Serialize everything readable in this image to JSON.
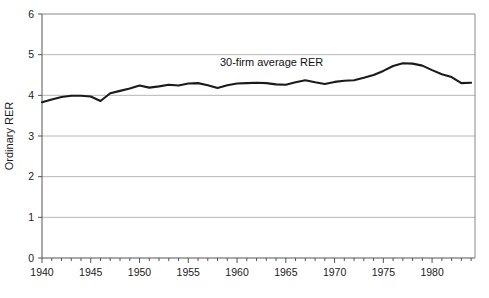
{
  "chart_data": {
    "type": "line",
    "title": "",
    "xlabel": "",
    "ylabel": "Ordinary RER",
    "xlim": [
      1940,
      1984.4
    ],
    "ylim": [
      0,
      6
    ],
    "grid": "horizontal",
    "legend_position": "inline-annotation",
    "ytick_labels": [
      "0",
      "1",
      "2",
      "3",
      "4",
      "5",
      "6"
    ],
    "yticks": [
      0,
      1,
      2,
      3,
      4,
      5,
      6
    ],
    "xtick_labels": [
      "1940",
      "1945",
      "1950",
      "1955",
      "1960",
      "1965",
      "1970",
      "1975",
      "1980"
    ],
    "xticks": [
      1940,
      1945,
      1950,
      1955,
      1960,
      1965,
      1970,
      1975,
      1980
    ],
    "minor_xtick_interval": 1,
    "series": [
      {
        "name": "30-firm average RER",
        "color": "#1a1a1a",
        "x": [
          1940,
          1941,
          1942,
          1943,
          1944,
          1945,
          1946,
          1947,
          1948,
          1949,
          1950,
          1951,
          1952,
          1953,
          1954,
          1955,
          1956,
          1957,
          1958,
          1959,
          1960,
          1961,
          1962,
          1963,
          1964,
          1965,
          1966,
          1967,
          1968,
          1969,
          1970,
          1971,
          1972,
          1973,
          1974,
          1975,
          1976,
          1977,
          1978,
          1979,
          1980,
          1981,
          1982,
          1983,
          1984
        ],
        "values": [
          3.83,
          3.9,
          3.96,
          3.99,
          3.99,
          3.97,
          3.86,
          4.05,
          4.11,
          4.17,
          4.24,
          4.19,
          4.22,
          4.26,
          4.24,
          4.29,
          4.3,
          4.25,
          4.18,
          4.25,
          4.29,
          4.3,
          4.31,
          4.3,
          4.27,
          4.26,
          4.32,
          4.37,
          4.32,
          4.28,
          4.33,
          4.36,
          4.37,
          4.43,
          4.5,
          4.6,
          4.72,
          4.79,
          4.78,
          4.73,
          4.62,
          4.52,
          4.45,
          4.3,
          4.31
        ]
      }
    ],
    "annotations": [
      {
        "text": "30-firm average RER",
        "x": 1968.5,
        "y": 4.72
      }
    ]
  }
}
